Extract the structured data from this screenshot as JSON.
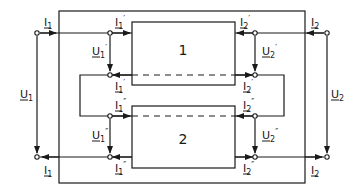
{
  "diagram": {
    "type": "two-port parallel connection circuit",
    "stroke_color": "#1a1a1a",
    "background": "#ffffff",
    "blocks": [
      {
        "id": "block-1",
        "label": "1"
      },
      {
        "id": "block-2",
        "label": "2"
      }
    ],
    "labels": {
      "I1_top": {
        "base": "I",
        "sub": "1",
        "prime": ""
      },
      "I1_bottom": {
        "base": "I",
        "sub": "1",
        "prime": ""
      },
      "I2_top": {
        "base": "I",
        "sub": "2",
        "prime": ""
      },
      "I2_bottom": {
        "base": "I",
        "sub": "2",
        "prime": ""
      },
      "U1": {
        "base": "U",
        "sub": "1",
        "prime": ""
      },
      "U2": {
        "base": "U",
        "sub": "2",
        "prime": ""
      },
      "I1p_top": {
        "base": "I",
        "sub": "1",
        "prime": "′"
      },
      "I1p_bottom": {
        "base": "I",
        "sub": "1",
        "prime": "′"
      },
      "I2p_top": {
        "base": "I",
        "sub": "2",
        "prime": "′"
      },
      "I2p_bottom": {
        "base": "I",
        "sub": "2",
        "prime": "′"
      },
      "U1p": {
        "base": "U",
        "sub": "1",
        "prime": "′"
      },
      "U2p": {
        "base": "U",
        "sub": "2",
        "prime": "′"
      },
      "I1pp_top": {
        "base": "I",
        "sub": "1",
        "prime": "″"
      },
      "I1pp_bottom": {
        "base": "I",
        "sub": "1",
        "prime": "″"
      },
      "I2pp_top": {
        "base": "I",
        "sub": "2",
        "prime": "″"
      },
      "I2pp_bottom": {
        "base": "I",
        "sub": "2",
        "prime": "″"
      },
      "U1pp": {
        "base": "U",
        "sub": "1",
        "prime": "″"
      },
      "U2pp": {
        "base": "U",
        "sub": "2",
        "prime": "″"
      }
    }
  }
}
